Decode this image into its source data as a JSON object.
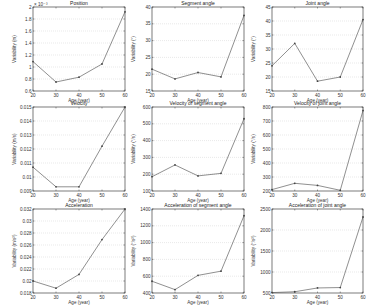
{
  "chart_data": [
    {
      "type": "line",
      "title": "Position",
      "xlabel": "Age (year)",
      "ylabel": "Variability (m)",
      "exponent_label": "× 10⁻³",
      "x": [
        20,
        30,
        40,
        50,
        60
      ],
      "values": [
        1.09,
        0.75,
        0.83,
        1.05,
        1.92
      ],
      "xlim": [
        20,
        60
      ],
      "ylim": [
        0.6,
        2.0
      ],
      "xticks": [
        "20",
        "30",
        "40",
        "50",
        "60"
      ],
      "yticks": [
        "0.6",
        "0.8",
        "1",
        "1.2",
        "1.4",
        "1.6",
        "1.8",
        "2"
      ],
      "ytick_values": [
        0.6,
        0.8,
        1.0,
        1.2,
        1.4,
        1.6,
        1.8,
        2.0
      ],
      "grid": true
    },
    {
      "type": "line",
      "title": "Segment angle",
      "xlabel": "Age (year)",
      "ylabel": "Variability (°)",
      "x": [
        20,
        30,
        40,
        50,
        60
      ],
      "values": [
        21.5,
        18.6,
        20.5,
        19.2,
        37.5
      ],
      "xlim": [
        20,
        60
      ],
      "ylim": [
        15,
        40
      ],
      "xticks": [
        "20",
        "30",
        "40",
        "50",
        "60"
      ],
      "yticks": [
        "15",
        "20",
        "25",
        "30",
        "35",
        "40"
      ],
      "ytick_values": [
        15,
        20,
        25,
        30,
        35,
        40
      ],
      "grid": true
    },
    {
      "type": "line",
      "title": "Joint angle",
      "xlabel": "Age (year)",
      "ylabel": "Variability (°)",
      "x": [
        20,
        30,
        40,
        50,
        60
      ],
      "values": [
        24,
        32,
        18.5,
        20,
        40.5
      ],
      "xlim": [
        20,
        60
      ],
      "ylim": [
        15,
        45
      ],
      "xticks": [
        "20",
        "30",
        "40",
        "50",
        "60"
      ],
      "yticks": [
        "15",
        "20",
        "25",
        "30",
        "35",
        "40",
        "45"
      ],
      "ytick_values": [
        15,
        20,
        25,
        30,
        35,
        40,
        45
      ],
      "grid": true
    },
    {
      "type": "line",
      "title": "Velocity",
      "xlabel": "Age (year)",
      "ylabel": "Variability (m/s)",
      "x": [
        20,
        30,
        40,
        50,
        60
      ],
      "values": [
        0.0107,
        0.0093,
        0.0093,
        0.0122,
        0.015
      ],
      "xlim": [
        20,
        60
      ],
      "ylim": [
        0.009,
        0.015
      ],
      "xticks": [
        "20",
        "30",
        "40",
        "50",
        "60"
      ],
      "yticks": [
        "0.009",
        "0.01",
        "0.011",
        "0.012",
        "0.013",
        "0.014",
        "0.015"
      ],
      "ytick_values": [
        0.009,
        0.01,
        0.011,
        0.012,
        0.013,
        0.014,
        0.015
      ],
      "grid": true
    },
    {
      "type": "line",
      "title": "Velocity of segment angle",
      "xlabel": "Age (year)",
      "ylabel": "Variability (°/s)",
      "x": [
        20,
        30,
        40,
        50,
        60
      ],
      "values": [
        185,
        255,
        190,
        205,
        530
      ],
      "xlim": [
        20,
        60
      ],
      "ylim": [
        100,
        600
      ],
      "xticks": [
        "20",
        "30",
        "40",
        "50",
        "60"
      ],
      "yticks": [
        "100",
        "200",
        "300",
        "400",
        "500",
        "600"
      ],
      "ytick_values": [
        100,
        200,
        300,
        400,
        500,
        600
      ],
      "grid": true
    },
    {
      "type": "line",
      "title": "Velocity of joint angle",
      "xlabel": "Age (year)",
      "ylabel": "Variability (°/s)",
      "x": [
        20,
        30,
        40,
        50,
        60
      ],
      "values": [
        210,
        255,
        240,
        205,
        775
      ],
      "xlim": [
        20,
        60
      ],
      "ylim": [
        200,
        800
      ],
      "xticks": [
        "20",
        "30",
        "40",
        "50",
        "60"
      ],
      "yticks": [
        "200",
        "300",
        "400",
        "500",
        "600",
        "700",
        "800"
      ],
      "ytick_values": [
        200,
        300,
        400,
        500,
        600,
        700,
        800
      ],
      "grid": true
    },
    {
      "type": "line",
      "title": "Acceleration",
      "xlabel": "Age (year)",
      "ylabel": "Variability (m/s²)",
      "x": [
        20,
        30,
        40,
        50,
        60
      ],
      "values": [
        0.02,
        0.0188,
        0.0211,
        0.0269,
        0.032
      ],
      "xlim": [
        20,
        60
      ],
      "ylim": [
        0.018,
        0.032
      ],
      "xticks": [
        "20",
        "30",
        "40",
        "50",
        "60"
      ],
      "yticks": [
        "0.018",
        "0.02",
        "0.022",
        "0.024",
        "0.026",
        "0.028",
        "0.03",
        "0.032"
      ],
      "ytick_values": [
        0.018,
        0.02,
        0.022,
        0.024,
        0.026,
        0.028,
        0.03,
        0.032
      ],
      "grid": true
    },
    {
      "type": "line",
      "title": "Acceleration of segment angle",
      "xlabel": "Age (year)",
      "ylabel": "Variability (°/s²)",
      "x": [
        20,
        30,
        40,
        50,
        60
      ],
      "values": [
        540,
        440,
        610,
        660,
        1320
      ],
      "xlim": [
        20,
        60
      ],
      "ylim": [
        400,
        1400
      ],
      "xticks": [
        "20",
        "30",
        "40",
        "50",
        "60"
      ],
      "yticks": [
        "400",
        "600",
        "800",
        "1000",
        "1200",
        "1400"
      ],
      "ytick_values": [
        400,
        600,
        800,
        1000,
        1200,
        1400
      ],
      "grid": true
    },
    {
      "type": "line",
      "title": "Acceleration of joint angle",
      "xlabel": "Age (year)",
      "ylabel": "Variability (°/s²)",
      "x": [
        20,
        30,
        40,
        50,
        60
      ],
      "values": [
        510,
        530,
        620,
        630,
        2310
      ],
      "xlim": [
        20,
        60
      ],
      "ylim": [
        500,
        2500
      ],
      "xticks": [
        "20",
        "30",
        "40",
        "50",
        "60"
      ],
      "yticks": [
        "500",
        "1000",
        "1500",
        "2000",
        "2500"
      ],
      "ytick_values": [
        500,
        1000,
        1500,
        2000,
        2500
      ],
      "grid": true
    }
  ],
  "style": {
    "line_color": "#444444",
    "grid_color": "#c8c8c8",
    "frame_color": "#222222"
  }
}
